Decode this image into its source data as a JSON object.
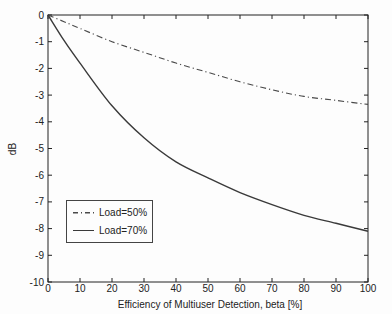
{
  "figure": {
    "background": "#fdfdfd",
    "axis_color": "#222222"
  },
  "chart_data": {
    "type": "line",
    "title": "",
    "xlabel": "Efficiency of Multiuser Detection, beta [%]",
    "ylabel": "dB",
    "xlim": [
      0,
      100
    ],
    "ylim": [
      -10,
      0
    ],
    "xticks": [
      0,
      10,
      20,
      30,
      40,
      50,
      60,
      70,
      80,
      90,
      100
    ],
    "yticks": [
      0,
      -1,
      -2,
      -3,
      -4,
      -5,
      -6,
      -7,
      -8,
      -9,
      -10
    ],
    "grid": false,
    "box": true,
    "ticks_on_all_sides": true,
    "legend_position": "lower-left",
    "x": [
      0,
      5,
      10,
      20,
      30,
      40,
      50,
      60,
      70,
      80,
      90,
      100
    ],
    "series": [
      {
        "name": "Load=50%",
        "line_style": "dash-dot",
        "color": "#4a4a4a",
        "values": [
          0,
          -0.25,
          -0.5,
          -1.0,
          -1.4,
          -1.8,
          -2.15,
          -2.5,
          -2.8,
          -3.05,
          -3.2,
          -3.35
        ]
      },
      {
        "name": "Load=70%",
        "line_style": "solid",
        "color": "#3a3a3a",
        "values": [
          0,
          -0.95,
          -1.8,
          -3.4,
          -4.6,
          -5.5,
          -6.1,
          -6.65,
          -7.1,
          -7.5,
          -7.8,
          -8.1
        ]
      }
    ]
  }
}
